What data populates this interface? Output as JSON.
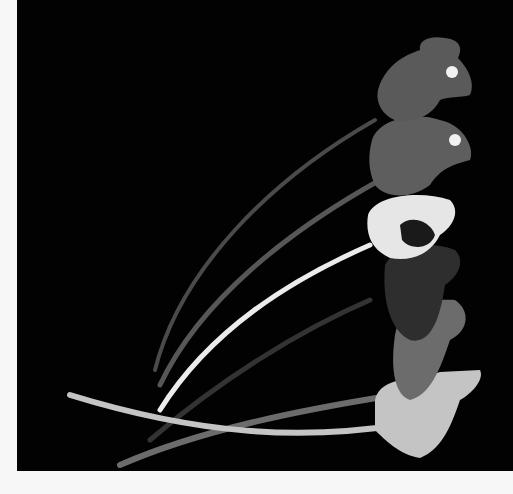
{
  "image": {
    "subject": "Illustration of six stacked mice with long curved tails on black background",
    "background_color": "#020202",
    "border_color": "#f7f7f7",
    "mice": [
      {
        "position": 1,
        "color": "#5a5a5a",
        "has_eye": true
      },
      {
        "position": 2,
        "color": "#5e5e5e",
        "has_eye": true
      },
      {
        "position": 3,
        "color": "#e6e6e6",
        "pattern": "white-with-black-patch"
      },
      {
        "position": 4,
        "color": "#2e2e2e"
      },
      {
        "position": 5,
        "color": "#6c6c6c"
      },
      {
        "position": 6,
        "color": "#c4c4c4"
      }
    ]
  }
}
